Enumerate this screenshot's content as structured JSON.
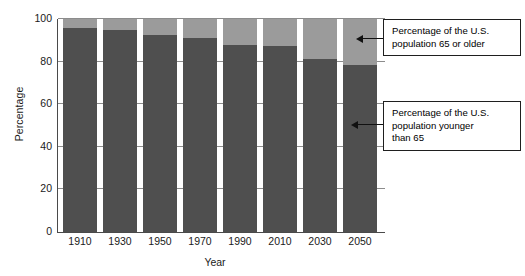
{
  "chart_data": {
    "type": "bar",
    "stacked": true,
    "title": "",
    "xlabel": "Year",
    "ylabel": "Percentage",
    "categories": [
      "1910",
      "1930",
      "1950",
      "1970",
      "1990",
      "2010",
      "2030",
      "2050"
    ],
    "ylim": [
      0,
      100
    ],
    "yticks": [
      0,
      20,
      40,
      60,
      80,
      100
    ],
    "ytick_labels": [
      "0",
      "20",
      "40",
      "60",
      "80",
      "100"
    ],
    "grid": true,
    "grid_axis": "y",
    "legend_position": "annotations-right",
    "series": [
      {
        "name": "Percentage of the U.S. population younger than 65",
        "color": "#4f4f4f",
        "values": [
          96,
          95,
          92.5,
          91,
          88,
          87.5,
          81,
          78.5
        ]
      },
      {
        "name": "Percentage of the U.S. population 65 or older",
        "color": "#9b9b9b",
        "values": [
          4,
          5,
          7.5,
          9,
          12,
          12.5,
          19,
          21.5
        ]
      }
    ],
    "annotations": [
      {
        "id": "older",
        "text": "Percentage of the U.S. population 65 or older",
        "line1": "Percentage of the U.S.",
        "line2": "population 65 or older",
        "line3": ""
      },
      {
        "id": "younger",
        "text": "Percentage of the U.S. population younger than 65",
        "line1": "Percentage of the U.S.",
        "line2": "population younger",
        "line3": "than 65"
      }
    ]
  },
  "colors": {
    "bar_dark": "#4f4f4f",
    "bar_light": "#9b9b9b",
    "axis": "#4a4a4a",
    "grid": "#8c8c8c",
    "text": "#1a1a1a",
    "background": "#ffffff"
  }
}
